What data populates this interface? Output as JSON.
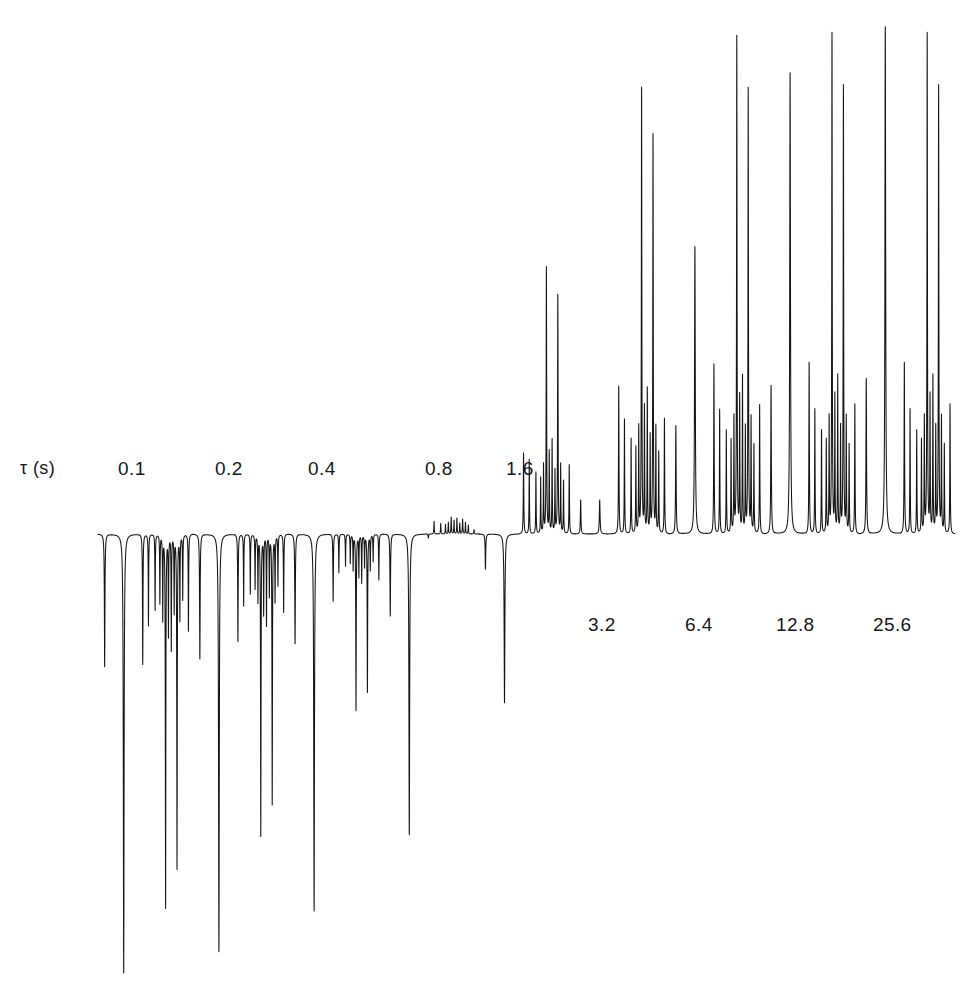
{
  "figure": {
    "kind": "nmr-inversion-recovery-stacked-spectra",
    "axis_label": "τ (s)",
    "background_color": "#ffffff",
    "trace_color": "#141414"
  },
  "chart_data": {
    "type": "line",
    "title": "",
    "subtitle": "",
    "xlabel": "",
    "ylabel": "",
    "legend_position": "none",
    "grid": false,
    "axis_label": "τ (s)",
    "series_variable": "τ (s)",
    "tau_values": [
      0.1,
      0.2,
      0.4,
      0.8,
      1.6,
      3.2,
      6.4,
      12.8,
      25.6
    ],
    "label_placement": {
      "above_baseline": [
        "0.1",
        "0.2",
        "0.4",
        "0.8",
        "1.6"
      ],
      "below_baseline": [
        "3.2",
        "6.4",
        "12.8",
        "25.6"
      ]
    },
    "peak_pattern": {
      "description": "Relative chemical-shift positions (0 = left edge of a spectrum block, 1 = right edge) and equilibrium relative intensities",
      "positions": [
        0.07,
        0.27,
        0.47,
        0.53,
        0.6,
        0.65,
        0.68,
        0.71,
        0.74,
        0.77,
        0.8,
        0.83,
        0.86,
        0.89,
        0.95
      ],
      "equilibrium_intensity": [
        0.3,
        0.98,
        0.33,
        0.24,
        0.2,
        0.18,
        0.22,
        0.96,
        0.26,
        0.3,
        0.2,
        0.86,
        0.22,
        0.17,
        0.25
      ],
      "relaxation_times_T1_s": [
        3.4,
        4.2,
        1.2,
        1.0,
        1.0,
        1.0,
        1.0,
        1.1,
        1.0,
        1.0,
        1.0,
        1.1,
        1.0,
        1.0,
        1.1
      ],
      "linewidth_rel": [
        0.0035,
        0.0045,
        0.003,
        0.0026,
        0.0026,
        0.0026,
        0.0026,
        0.003,
        0.0026,
        0.0026,
        0.0026,
        0.003,
        0.0026,
        0.0026,
        0.0028
      ]
    },
    "series": [
      {
        "name": "0.1",
        "tau": 0.1,
        "sign": "all-negative",
        "label_above": true
      },
      {
        "name": "0.2",
        "tau": 0.2,
        "sign": "all-negative",
        "label_above": true
      },
      {
        "name": "0.4",
        "tau": 0.4,
        "sign": "mostly-negative",
        "label_above": true
      },
      {
        "name": "0.8",
        "tau": 0.8,
        "sign": "mixed",
        "label_above": true
      },
      {
        "name": "1.6",
        "tau": 1.6,
        "sign": "mixed",
        "label_above": true
      },
      {
        "name": "3.2",
        "tau": 3.2,
        "sign": "mostly-positive",
        "label_above": false
      },
      {
        "name": "6.4",
        "tau": 6.4,
        "sign": "all-positive",
        "label_above": false
      },
      {
        "name": "12.8",
        "tau": 12.8,
        "sign": "all-positive",
        "label_above": false
      },
      {
        "name": "25.6",
        "tau": 25.6,
        "sign": "all-positive",
        "label_above": false
      }
    ]
  },
  "labels": {
    "tau_axis": "τ (s)",
    "top_row": [
      "0.1",
      "0.2",
      "0.4",
      "0.8",
      "1.6"
    ],
    "bottom_row": [
      "3.2",
      "6.4",
      "12.8",
      "25.6"
    ]
  }
}
